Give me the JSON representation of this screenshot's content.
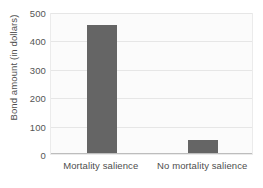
{
  "chart_data": {
    "type": "bar",
    "title": "",
    "xlabel": "",
    "ylabel": "Bond amount (in dollars)",
    "categories": [
      "Mortality salience",
      "No mortality salience"
    ],
    "values": [
      450,
      45
    ],
    "ylim": [
      0,
      500
    ],
    "yticks": [
      0,
      100,
      200,
      300,
      400,
      500
    ],
    "ytick_labels": [
      "0",
      "100",
      "200",
      "300",
      "400",
      "500"
    ],
    "grid": true,
    "grid_axis": "y",
    "legend": false,
    "legend_position": "none",
    "bar_color": "#656565",
    "plot_background": "#fbfbfb",
    "gridline_color": "#e6e6e6",
    "axis_color": "#bdbdbd",
    "text_color": "#4e4e4e"
  }
}
